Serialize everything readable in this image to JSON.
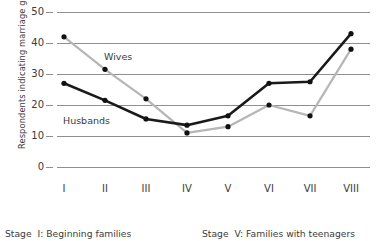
{
  "chart_data": {
    "type": "line",
    "title": "",
    "xlabel": "Stage",
    "ylabel": "Respondents indicating marriage going well (%)",
    "categories": [
      "I",
      "II",
      "III",
      "IV",
      "V",
      "VI",
      "VII",
      "VIII"
    ],
    "ylim": [
      0,
      50
    ],
    "yticks": [
      0,
      10,
      20,
      30,
      40,
      50
    ],
    "grid": true,
    "legend": "inline-annotations",
    "series": [
      {
        "name": "Husbands",
        "color": "#1a1a1a",
        "values": [
          27,
          21.5,
          15.5,
          13.5,
          16.5,
          27,
          27.5,
          43
        ]
      },
      {
        "name": "Wives",
        "color": "#b6b6b6",
        "values": [
          42,
          31.5,
          22,
          11,
          13,
          20,
          16.5,
          38
        ]
      }
    ],
    "annotations": [
      {
        "text": "Wives",
        "x_category": "II",
        "y_value": 36
      },
      {
        "text": "Husbands",
        "x_category": "II",
        "y_value": 17
      }
    ]
  },
  "axis": {
    "y_tick_labels": [
      "50",
      "40",
      "30",
      "20",
      "10",
      "0"
    ],
    "x_tick_labels": [
      "I",
      "II",
      "III",
      "IV",
      "V",
      "VI",
      "VII",
      "VIII"
    ],
    "y_title": "Respondents indicating marriage going well (%)"
  },
  "legend": {
    "wives_label": "Wives",
    "husbands_label": "Husbands"
  },
  "caption": {
    "left_stage_word": "Stage",
    "left_text": "I: Beginning families",
    "right_stage_word": "Stage",
    "right_text": "V: Families with teenagers"
  },
  "colors": {
    "husbands": "#1a1a1a",
    "wives": "#b6b6b6",
    "grid": "#8f8f8f",
    "text": "#3b3b3b",
    "background": "#ffffff"
  }
}
